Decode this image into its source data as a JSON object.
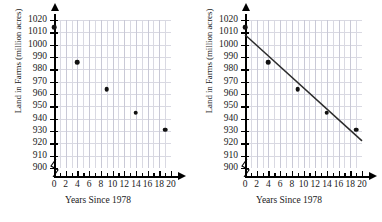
{
  "figure": {
    "panels": [
      {
        "name": "scatter-plot",
        "has_trend_line": false,
        "xtitle": "Years Since 1978",
        "ytitle": "Land in Farms (million acres)"
      },
      {
        "name": "scatter-plot-with-line-of-best-fit",
        "has_trend_line": true,
        "xtitle": "Years Since 1978",
        "ytitle": "Land in Farms (million acres)"
      }
    ]
  },
  "chart_data": {
    "type": "scatter",
    "title": "",
    "xlabel": "Years Since 1978",
    "ylabel": "Land in Farms (million acres)",
    "xlim": [
      0,
      20
    ],
    "ylim": [
      900,
      1020
    ],
    "y_axis_break_below": 900,
    "grid": true,
    "legend": "none",
    "x_ticks": [
      0,
      1,
      2,
      3,
      4,
      5,
      6,
      7,
      8,
      9,
      10,
      11,
      12,
      13,
      14,
      15,
      16,
      17,
      18,
      19,
      20
    ],
    "x_tick_labels": [
      "0",
      "2",
      "4",
      "6",
      "8",
      "10",
      "12",
      "14",
      "16",
      "18",
      "20"
    ],
    "x_tick_label_values": [
      0,
      2,
      4,
      6,
      8,
      10,
      12,
      14,
      16,
      18,
      20
    ],
    "y_ticks": [
      900,
      910,
      920,
      930,
      940,
      950,
      960,
      970,
      980,
      990,
      1000,
      1010,
      1020
    ],
    "y_tick_labels": [
      "900",
      "910",
      "920",
      "930",
      "940",
      "950",
      "960",
      "970",
      "980",
      "990",
      "1000",
      "1010",
      "1020"
    ],
    "points": [
      {
        "x": 0,
        "y": 1014
      },
      {
        "x": 4,
        "y": 986
      },
      {
        "x": 9,
        "y": 964
      },
      {
        "x": 14,
        "y": 945
      },
      {
        "x": 19,
        "y": 931
      }
    ],
    "trend_line": {
      "x_start": 0,
      "y_start": 1008,
      "x_end": 20,
      "y_end": 922,
      "slope": -4.3,
      "intercept": 1008,
      "color": "#2b2b2b"
    },
    "marker_color": "#111111",
    "grid_color": "#d9d9e2",
    "axis_color": "#000000"
  }
}
